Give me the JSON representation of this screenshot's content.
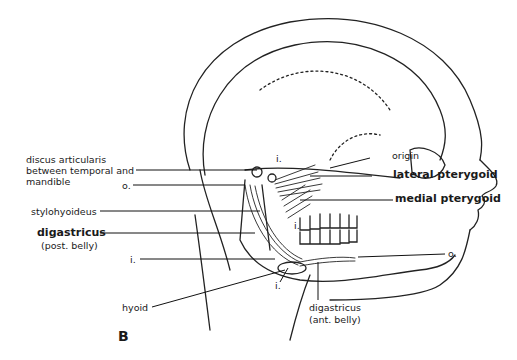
{
  "figure": {
    "panel_letter": "B",
    "labels": {
      "discus_articularis": [
        "discus articularis",
        "between temporal and",
        "mandible"
      ],
      "origin_o_left": "o.",
      "stylohyoideus": "stylohyoideus",
      "digastricus_post": "digastricus",
      "digastricus_post_sub": "(post. belly)",
      "insertion_i_left": "i.",
      "hyoid": "hyoid",
      "insertion_i_top": "i.",
      "insertion_i_teeth": "i.",
      "insertion_i_hyoid": "i.",
      "origin": "origin",
      "lateral_pterygoid": "lateral pterygoid",
      "medial_pterygoid": "medial pterygoid",
      "origin_o_right": "o.",
      "digastricus_ant": "digastricus",
      "digastricus_ant_sub": "(ant. belly)"
    }
  }
}
